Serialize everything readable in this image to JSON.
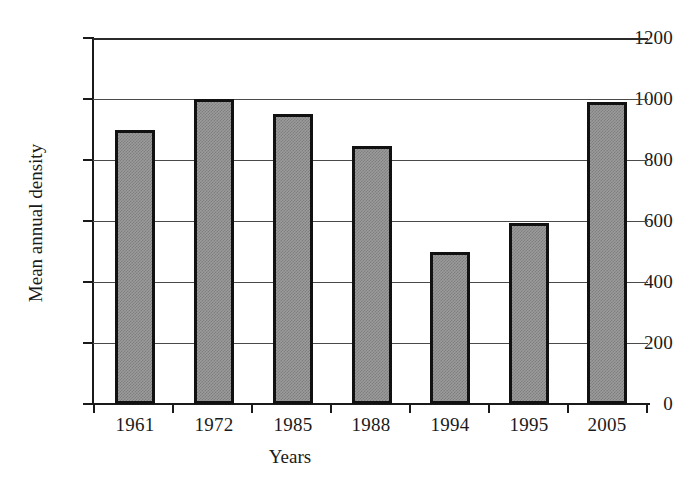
{
  "chart_data": {
    "type": "bar",
    "title": "",
    "xlabel": "Years",
    "ylabel": "Mean annual density",
    "categories": [
      "1961",
      "1972",
      "1985",
      "1988",
      "1994",
      "1995",
      "2005"
    ],
    "values": [
      900,
      1000,
      950,
      845,
      500,
      595,
      990
    ],
    "ylim": [
      0,
      1200
    ],
    "ytick_labels": [
      "0",
      "200",
      "400",
      "600",
      "800",
      "1000",
      "1200"
    ],
    "ytick_values": [
      0,
      200,
      400,
      600,
      800,
      1000,
      1200
    ],
    "grid": "horizontal",
    "legend": "none",
    "series": [
      {
        "name": "Mean annual density",
        "values": [
          900,
          1000,
          950,
          845,
          500,
          595,
          990
        ]
      }
    ],
    "colors": {
      "bar_fill": "#9b9b9b",
      "bar_pattern": "#7e7e7e",
      "bar_border": "#111111",
      "axis": "#1a1a1a",
      "gridline": "#4a4a4a",
      "background": "#ffffff",
      "text": "#1a1a1a"
    }
  }
}
